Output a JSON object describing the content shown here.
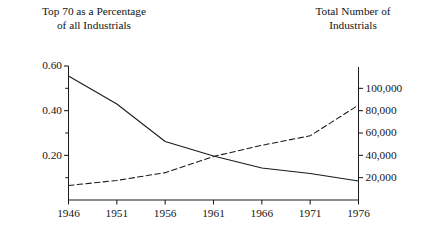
{
  "titles": {
    "left": "Top 70 as a Percentage\nof all Industrials",
    "right": "Total Number of\nIndustrials"
  },
  "chart_data": {
    "type": "line",
    "title": "",
    "subtitle": "",
    "xlabel": "",
    "ylabel": "Top 70 as a Percentage of all Industrials",
    "y2label": "Total Number of Industrials",
    "grid": false,
    "legend": "none",
    "x": [
      1946,
      1951,
      1956,
      1961,
      1966,
      1971,
      1976
    ],
    "xlim": [
      1946,
      1976
    ],
    "xticklabels": [
      "1946",
      "1951",
      "1956",
      "1961",
      "1966",
      "1971",
      "1976"
    ],
    "ylim": [
      0.0,
      0.6
    ],
    "yticks": [
      0.2,
      0.4,
      0.6
    ],
    "yticklabels": [
      "0.20",
      "0.40",
      "0.60"
    ],
    "yminorticks": [
      0.1,
      0.3,
      0.5
    ],
    "y2lim": [
      0,
      120000
    ],
    "y2ticks": [
      20000,
      40000,
      60000,
      80000,
      100000
    ],
    "y2ticklabels": [
      "20,000",
      "40,000",
      "60,000",
      "80,000",
      "100,000"
    ],
    "series": [
      {
        "name": "Top 70 as a Percentage of all Industrials",
        "axis": "left",
        "style": "solid",
        "color": "#1a1a1a",
        "values": [
          0.555,
          0.43,
          0.262,
          0.197,
          0.143,
          0.119,
          0.085
        ]
      },
      {
        "name": "Total Number of Industrials",
        "axis": "right",
        "style": "dashed",
        "color": "#1a1a1a",
        "values": [
          13000,
          17500,
          24500,
          39000,
          49000,
          57500,
          85000
        ]
      }
    ]
  }
}
